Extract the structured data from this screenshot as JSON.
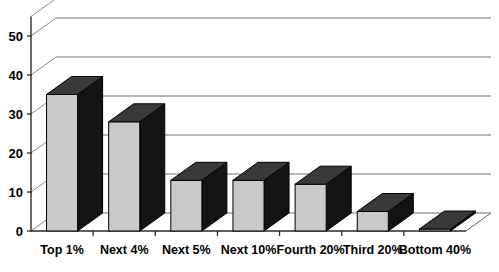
{
  "chart_data": {
    "type": "bar",
    "title": "",
    "subtitle": "",
    "xlabel": "",
    "ylabel": "",
    "categories": [
      "Top 1%",
      "Next 4%",
      "Next 5%",
      "Next 10%",
      "Fourth 20%",
      "Third 20%",
      "Bottom 40%"
    ],
    "values": [
      35,
      28,
      13,
      13,
      12,
      5,
      0.5
    ],
    "ylim": [
      0,
      50
    ],
    "yticks": [
      0,
      10,
      20,
      30,
      40,
      50
    ],
    "ytick_labels": [
      "0",
      "10",
      "20",
      "30",
      "40",
      "50"
    ],
    "grid": true,
    "grid_axis": "y",
    "legend": false,
    "legend_position": "none",
    "style": "3d-bar",
    "colors": {
      "bar_front": "#c9c9c9",
      "bar_top": "#3a3a3a",
      "bar_side": "#141414",
      "bar_outline": "#000000",
      "gridline": "#6f6f6f",
      "axis": "#2b2b2b",
      "background": "#ffffff",
      "text": "#000000"
    }
  }
}
